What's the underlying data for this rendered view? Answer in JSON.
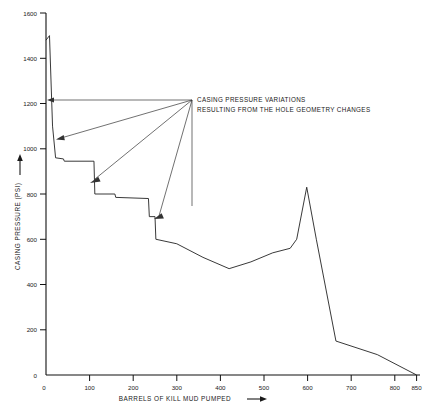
{
  "chart_data": {
    "type": "line",
    "title": "",
    "xlabel": "BARRELS OF KILL MUD PUMPED",
    "ylabel": "CASING PRESSURE (PSI)",
    "xlim": [
      0,
      850
    ],
    "ylim": [
      0,
      1600
    ],
    "grid": false,
    "legend": "none",
    "x_ticks": [
      0,
      100,
      200,
      300,
      400,
      500,
      600,
      700,
      800,
      850
    ],
    "x_tick_labels": [
      "0",
      "100",
      "200",
      "300",
      "400",
      "500",
      "600",
      "700",
      "800",
      "850"
    ],
    "y_ticks": [
      0,
      200,
      400,
      600,
      800,
      1000,
      1200,
      1400,
      1600
    ],
    "y_tick_labels": [
      "0",
      "200",
      "400",
      "600",
      "800",
      "1000",
      "1200",
      "1400",
      "1600"
    ],
    "series": [
      {
        "name": "Casing pressure",
        "points": [
          [
            0,
            1480
          ],
          [
            8,
            1500
          ],
          [
            15,
            1100
          ],
          [
            22,
            960
          ],
          [
            40,
            955
          ],
          [
            42,
            945
          ],
          [
            110,
            945
          ],
          [
            112,
            800
          ],
          [
            158,
            800
          ],
          [
            160,
            785
          ],
          [
            235,
            780
          ],
          [
            237,
            700
          ],
          [
            250,
            700
          ],
          [
            252,
            600
          ],
          [
            300,
            580
          ],
          [
            360,
            520
          ],
          [
            420,
            470
          ],
          [
            470,
            500
          ],
          [
            520,
            540
          ],
          [
            560,
            560
          ],
          [
            575,
            600
          ],
          [
            598,
            830
          ],
          [
            620,
            600
          ],
          [
            665,
            150
          ],
          [
            760,
            90
          ],
          [
            850,
            0
          ]
        ]
      }
    ],
    "annotations": [
      {
        "lines": [
          "CASING PRESSURE VARIATIONS",
          "RESULTING FROM THE HOLE GEOMETRY CHANGES"
        ],
        "anchor_x": 335,
        "anchor_y": 1220,
        "arrow_targets": [
          [
            10,
            1220
          ],
          [
            28,
            1048
          ],
          [
            105,
            860
          ],
          [
            252,
            700
          ]
        ]
      }
    ]
  },
  "axis_arrow_symbols": {
    "y_axis_arrow": "up-arrow-icon",
    "x_axis_arrow": "right-arrow-icon"
  }
}
